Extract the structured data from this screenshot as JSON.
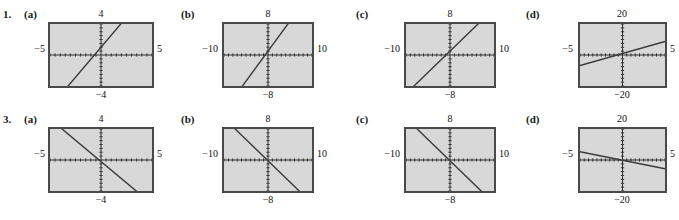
{
  "page": {
    "background_color": "#ffffff",
    "plot_background_color": "#d8d8d8",
    "frame_color": "#4a4a4a",
    "curve_color": "#3a3a3a"
  },
  "exercises": [
    {
      "number": "1.",
      "panels": [
        {
          "label": "(a)",
          "chart_data": {
            "type": "line",
            "title": "",
            "xlabel": "",
            "ylabel": "",
            "xlim": [
              -5,
              5
            ],
            "ylim": [
              -4,
              4
            ],
            "tick_labels": {
              "top": "4",
              "bottom": "−4",
              "left": "−5",
              "right": "5"
            },
            "grid": false,
            "axis_ticks": true,
            "series": [
              {
                "name": "line",
                "slope": 1.55,
                "intercept": 1.0,
                "x": [
                  -5,
                  5
                ],
                "y": [
                  -6.75,
                  8.75
                ]
              }
            ]
          }
        },
        {
          "label": "(b)",
          "chart_data": {
            "type": "line",
            "title": "",
            "xlabel": "",
            "ylabel": "",
            "xlim": [
              -10,
              10
            ],
            "ylim": [
              -8,
              8
            ],
            "tick_labels": {
              "top": "8",
              "bottom": "−8",
              "left": "−10",
              "right": "10"
            },
            "grid": false,
            "axis_ticks": true,
            "series": [
              {
                "name": "line",
                "slope": 1.55,
                "intercept": 1.0,
                "x": [
                  -10,
                  10
                ],
                "y": [
                  -14.5,
                  16.5
                ]
              }
            ]
          }
        },
        {
          "label": "(c)",
          "chart_data": {
            "type": "line",
            "title": "",
            "xlabel": "",
            "ylabel": "",
            "xlim": [
              -10,
              10
            ],
            "ylim": [
              -8,
              8
            ],
            "tick_labels": {
              "top": "8",
              "bottom": "−8",
              "left": "−10",
              "right": "10"
            },
            "grid": false,
            "axis_ticks": true,
            "series": [
              {
                "name": "line",
                "slope": 1.1,
                "intercept": 1.0,
                "x": [
                  -10,
                  10
                ],
                "y": [
                  -10.0,
                  12.0
                ]
              }
            ]
          }
        },
        {
          "label": "(d)",
          "chart_data": {
            "type": "line",
            "title": "",
            "xlabel": "",
            "ylabel": "",
            "xlim": [
              -5,
              5
            ],
            "ylim": [
              -20,
              20
            ],
            "tick_labels": {
              "top": "20",
              "bottom": "−20",
              "left": "−5",
              "right": "5"
            },
            "grid": false,
            "axis_ticks": true,
            "series": [
              {
                "name": "line",
                "slope": 1.55,
                "intercept": 1.0,
                "x": [
                  -5,
                  5
                ],
                "y": [
                  -6.75,
                  8.75
                ]
              }
            ]
          }
        }
      ]
    },
    {
      "number": "3.",
      "panels": [
        {
          "label": "(a)",
          "chart_data": {
            "type": "line",
            "title": "",
            "xlabel": "",
            "ylabel": "",
            "xlim": [
              -5,
              5
            ],
            "ylim": [
              -4,
              4
            ],
            "tick_labels": {
              "top": "4",
              "bottom": "−4",
              "left": "−5",
              "right": "5"
            },
            "grid": false,
            "axis_ticks": true,
            "series": [
              {
                "name": "line",
                "slope": -1.1,
                "intercept": -0.2,
                "x": [
                  -5,
                  5
                ],
                "y": [
                  5.3,
                  -5.7
                ]
              }
            ]
          }
        },
        {
          "label": "(b)",
          "chart_data": {
            "type": "line",
            "title": "",
            "xlabel": "",
            "ylabel": "",
            "xlim": [
              -10,
              10
            ],
            "ylim": [
              -8,
              8
            ],
            "tick_labels": {
              "top": "8",
              "bottom": "−8",
              "left": "−10",
              "right": "10"
            },
            "grid": false,
            "axis_ticks": true,
            "series": [
              {
                "name": "line",
                "slope": -1.1,
                "intercept": -0.2,
                "x": [
                  -10,
                  10
                ],
                "y": [
                  10.8,
                  -11.2
                ]
              }
            ]
          }
        },
        {
          "label": "(c)",
          "chart_data": {
            "type": "line",
            "title": "",
            "xlabel": "",
            "ylabel": "",
            "xlim": [
              -10,
              10
            ],
            "ylim": [
              -8,
              8
            ],
            "tick_labels": {
              "top": "8",
              "bottom": "−8",
              "left": "−10",
              "right": "10"
            },
            "grid": false,
            "axis_ticks": true,
            "series": [
              {
                "name": "line",
                "slope": -1.1,
                "intercept": -0.2,
                "x": [
                  -10,
                  10
                ],
                "y": [
                  10.8,
                  -11.2
                ]
              }
            ]
          }
        },
        {
          "label": "(d)",
          "chart_data": {
            "type": "line",
            "title": "",
            "xlabel": "",
            "ylabel": "",
            "xlim": [
              -5,
              5
            ],
            "ylim": [
              -20,
              20
            ],
            "tick_labels": {
              "top": "20",
              "bottom": "−20",
              "left": "−5",
              "right": "5"
            },
            "grid": false,
            "axis_ticks": true,
            "series": [
              {
                "name": "line",
                "slope": -1.1,
                "intercept": -0.2,
                "x": [
                  -5,
                  5
                ],
                "y": [
                  5.3,
                  -5.7
                ]
              }
            ]
          }
        }
      ]
    }
  ]
}
